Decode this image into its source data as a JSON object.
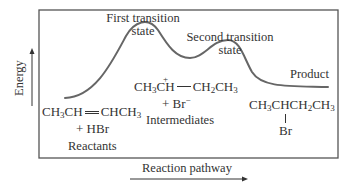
{
  "diagram": {
    "type": "reaction-energy-profile",
    "y_axis_label": "Energy",
    "x_axis_label": "Reaction pathway",
    "stages": {
      "reactants": {
        "formula_parts": [
          "CH",
          "3",
          "CH",
          "CHCH",
          "3"
        ],
        "formula_text": "CH3CH=CHCH3",
        "second_line": "+ HBr",
        "label": "Reactants"
      },
      "first_transition_state": {
        "label_line1": "First transition",
        "label_line2": "state"
      },
      "intermediates": {
        "formula_text": "CH3CH(+)—CH2CH3",
        "formula_parts": [
          "CH",
          "3",
          "CH",
          "+",
          "CH",
          "2",
          "CH",
          "3"
        ],
        "second_line_plus": "+ Br",
        "second_line_charge": "−",
        "label": "Intermediates"
      },
      "second_transition_state": {
        "label_line1": "Second transition",
        "label_line2": "state"
      },
      "product": {
        "label": "Product",
        "formula_text": "CH3CHCH2CH3 with Br on C2",
        "formula_parts": [
          "CH",
          "3",
          "CHCH",
          "2",
          "CH",
          "3"
        ],
        "substituent": "Br"
      }
    },
    "colors": {
      "curve": "#666666",
      "frame": "#555555",
      "text": "#333333",
      "background": "#ffffff"
    }
  }
}
